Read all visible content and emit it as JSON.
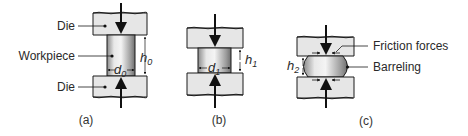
{
  "figure": {
    "panels": [
      {
        "id": "a",
        "caption": "(a)",
        "labels": {
          "top_die": "Die",
          "workpiece": "Workpiece",
          "bottom_die": "Die"
        },
        "dimensions": {
          "diameter": "d",
          "diameter_sub": "0",
          "height": "h",
          "height_sub": "0"
        }
      },
      {
        "id": "b",
        "caption": "(b)",
        "dimensions": {
          "diameter": "d",
          "diameter_sub": "1",
          "height": "h",
          "height_sub": "1"
        }
      },
      {
        "id": "c",
        "caption": "(c)",
        "labels": {
          "friction": "Friction forces",
          "barreling": "Barreling"
        },
        "dimensions": {
          "height": "h",
          "height_sub": "2"
        }
      }
    ],
    "colors": {
      "die_fill": "#e6e6e6",
      "outline": "#1a1a1a",
      "text": "#2a2a2a"
    }
  }
}
